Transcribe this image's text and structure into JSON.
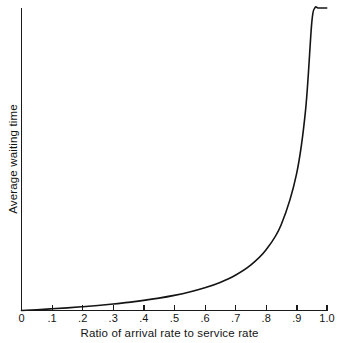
{
  "chart_data": {
    "type": "line",
    "title": "",
    "xlabel": "Ratio of arrival rate to service rate",
    "ylabel": "Average waiting time",
    "xlim": [
      0,
      1.0
    ],
    "ylim": [
      0,
      20
    ],
    "grid": false,
    "legend": null,
    "x_tick_labels": [
      "0",
      ".1",
      ".2",
      ".3",
      ".4",
      ".5",
      ".6",
      ".7",
      ".8",
      ".9",
      "1.0"
    ],
    "x_tick_values": [
      0,
      0.1,
      0.2,
      0.3,
      0.4,
      0.5,
      0.6,
      0.7,
      0.8,
      0.9,
      1.0
    ],
    "y_tick_labels": [],
    "series": [
      {
        "name": "Average waiting time",
        "formula": "rho / (1 - rho)",
        "color": "#141414",
        "x": [
          0.0,
          0.05,
          0.1,
          0.15,
          0.2,
          0.25,
          0.3,
          0.35,
          0.4,
          0.45,
          0.5,
          0.55,
          0.6,
          0.65,
          0.7,
          0.75,
          0.8,
          0.85,
          0.9,
          0.93,
          0.95,
          0.96,
          0.97,
          0.98,
          0.985,
          0.99,
          0.993,
          0.995,
          0.997,
          0.998,
          0.999,
          1.0
        ],
        "values": [
          0.0,
          0.053,
          0.111,
          0.176,
          0.25,
          0.333,
          0.429,
          0.538,
          0.667,
          0.818,
          1.0,
          1.222,
          1.5,
          1.857,
          2.333,
          3.0,
          4.0,
          5.667,
          9.0,
          13.286,
          19.0,
          24.0,
          32.333,
          49.0,
          65.667,
          99.0,
          141.86,
          199.0,
          332.33,
          499.0,
          999.0,
          null
        ]
      }
    ],
    "annotations": []
  },
  "axis": {
    "x_tick_labels": [
      "0",
      ".1",
      ".2",
      ".3",
      ".4",
      ".5",
      ".6",
      ".7",
      ".8",
      ".9",
      "1.0"
    ],
    "x_title": "Ratio of arrival rate to service rate",
    "y_title": "Average waiting time"
  },
  "colors": {
    "curve": "#141414",
    "axis": "#1a1a1a",
    "background": "#ffffff"
  }
}
